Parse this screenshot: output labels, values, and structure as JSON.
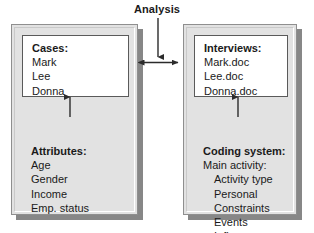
{
  "diagram": {
    "title": "Analysis",
    "left_panel": {
      "name": "cases-panel",
      "box": {
        "heading": "Cases:",
        "items": [
          "Mark",
          "Lee",
          "Donna"
        ]
      },
      "list": {
        "heading": "Attributes:",
        "items": [
          "Age",
          "Gender",
          "Income",
          "Emp. status"
        ]
      }
    },
    "right_panel": {
      "name": "interviews-panel",
      "box": {
        "heading": "Interviews:",
        "items": [
          "Mark.doc",
          "Lee.doc",
          "Donna.doc"
        ]
      },
      "list": {
        "heading": "Coding system:",
        "subheading": "Main activity:",
        "items": [
          "Activity type",
          "Personal",
          "Constraints",
          "Events",
          "Influences"
        ]
      }
    },
    "connectors": [
      {
        "name": "analysis-down-arrow",
        "direction": "down"
      },
      {
        "name": "panel-link-double-arrow",
        "direction": "both"
      },
      {
        "name": "attributes-up-arrow",
        "direction": "up"
      },
      {
        "name": "coding-up-arrow",
        "direction": "up"
      }
    ],
    "colors": {
      "panel_fill": "#e2e2e2",
      "panel_border": "#8f8f8f",
      "panel_shadow": "#878787",
      "box_fill": "#ffffff",
      "box_border": "#5a5a5a",
      "text": "#1a1a1a",
      "arrow": "#2b2b2b",
      "background": "#ffffff"
    }
  }
}
